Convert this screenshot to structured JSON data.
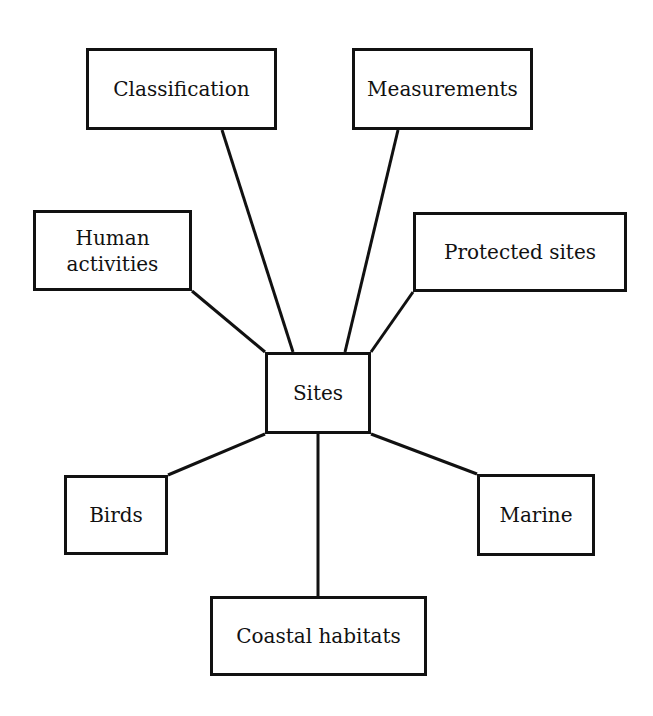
{
  "diagram": {
    "type": "hub-and-spoke",
    "line_color": "#111111",
    "center": {
      "id": "sites",
      "label": "Sites",
      "box": {
        "x": 265,
        "y": 352,
        "w": 106,
        "h": 82
      }
    },
    "nodes": [
      {
        "id": "classification",
        "label": "Classification",
        "box": {
          "x": 86,
          "y": 48,
          "w": 191,
          "h": 82
        }
      },
      {
        "id": "measurements",
        "label": "Measurements",
        "box": {
          "x": 352,
          "y": 48,
          "w": 181,
          "h": 82
        }
      },
      {
        "id": "human-activities",
        "label": "Human\nactivities",
        "box": {
          "x": 33,
          "y": 210,
          "w": 159,
          "h": 81
        }
      },
      {
        "id": "protected-sites",
        "label": "Protected sites",
        "box": {
          "x": 413,
          "y": 212,
          "w": 214,
          "h": 80
        }
      },
      {
        "id": "birds",
        "label": "Birds",
        "box": {
          "x": 64,
          "y": 475,
          "w": 104,
          "h": 80
        }
      },
      {
        "id": "marine",
        "label": "Marine",
        "box": {
          "x": 477,
          "y": 474,
          "w": 118,
          "h": 82
        }
      },
      {
        "id": "coastal-habitats",
        "label": "Coastal habitats",
        "box": {
          "x": 210,
          "y": 596,
          "w": 217,
          "h": 80
        }
      }
    ],
    "edges": [
      {
        "from": "sites",
        "to": "classification",
        "x1": 293,
        "y1": 352,
        "x2": 222,
        "y2": 130
      },
      {
        "from": "sites",
        "to": "measurements",
        "x1": 345,
        "y1": 352,
        "x2": 398,
        "y2": 130
      },
      {
        "from": "sites",
        "to": "human-activities",
        "x1": 265,
        "y1": 352,
        "x2": 192,
        "y2": 291
      },
      {
        "from": "sites",
        "to": "protected-sites",
        "x1": 371,
        "y1": 352,
        "x2": 413,
        "y2": 292
      },
      {
        "from": "sites",
        "to": "birds",
        "x1": 265,
        "y1": 434,
        "x2": 168,
        "y2": 475
      },
      {
        "from": "sites",
        "to": "marine",
        "x1": 371,
        "y1": 434,
        "x2": 477,
        "y2": 474
      },
      {
        "from": "sites",
        "to": "coastal-habitats",
        "x1": 318,
        "y1": 434,
        "x2": 318,
        "y2": 596
      }
    ]
  }
}
